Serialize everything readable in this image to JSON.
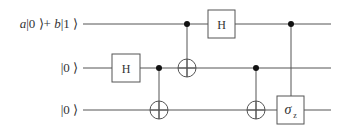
{
  "diagram": {
    "type": "quantum-circuit",
    "colors": {
      "wire": "#555555",
      "gate_border": "#555555",
      "gate_fill": "#ffffff",
      "dot": "#111111",
      "text": "#333333"
    },
    "qubits": [
      {
        "label": "a|0 ⟩+ b|1 ⟩",
        "label_parts": {
          "a": "a",
          "ket0": "|0 ⟩+ ",
          "b": "b",
          "ket1": "|1 ⟩"
        },
        "y": 24
      },
      {
        "label": "|0 ⟩",
        "y": 68
      },
      {
        "label": "|0 ⟩",
        "y": 110
      }
    ],
    "gates": [
      {
        "type": "H",
        "label": "H",
        "qubit": 1,
        "x": 126
      },
      {
        "type": "CNOT",
        "control": 1,
        "target": 2,
        "x": 159
      },
      {
        "type": "CNOT",
        "control": 0,
        "target": 1,
        "x": 187
      },
      {
        "type": "H",
        "label": "H",
        "qubit": 0,
        "x": 221
      },
      {
        "type": "CNOT",
        "control": 1,
        "target": 2,
        "x": 256
      },
      {
        "type": "controlled-gate",
        "label": "σ",
        "subscript": "z",
        "control": 0,
        "target": 2,
        "x": 291
      }
    ]
  }
}
